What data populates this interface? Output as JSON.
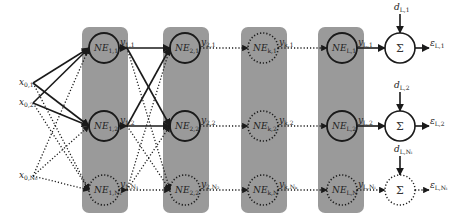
{
  "diagram": {
    "type": "layered-network-error-diagram",
    "colors": {
      "panel": "#9a9a9a",
      "stroke": "#1a1a1a",
      "background": "#ffffff"
    },
    "inputs": [
      {
        "base": "x",
        "sub": "0,1"
      },
      {
        "base": "x",
        "sub": "0,2"
      },
      {
        "base": "x",
        "sub": "0,N₀"
      }
    ],
    "layers": [
      {
        "index": 1,
        "nodes": [
          {
            "label": "NE",
            "sub": "1,1",
            "style": "solid",
            "out_base": "y",
            "out_sub": "1,1"
          },
          {
            "label": "NE",
            "sub": "1,2",
            "style": "solid",
            "out_base": "y",
            "out_sub": "1,2"
          },
          {
            "label": "NE",
            "sub": "1,N₁",
            "style": "dotted",
            "out_base": "y",
            "out_sub": "1,N₁"
          }
        ]
      },
      {
        "index": 2,
        "nodes": [
          {
            "label": "NE",
            "sub": "2,1",
            "style": "solid",
            "out_base": "y",
            "out_sub": "2,1"
          },
          {
            "label": "NE",
            "sub": "2,2",
            "style": "solid",
            "out_base": "y",
            "out_sub": "2,2"
          },
          {
            "label": "NE",
            "sub": "2,2",
            "style": "dotted",
            "out_base": "y",
            "out_sub": "2,N₂"
          }
        ]
      },
      {
        "index": "k",
        "nodes": [
          {
            "label": "NE",
            "sub": "k,1",
            "style": "dotted",
            "out_base": "y",
            "out_sub": "k,1"
          },
          {
            "label": "NE",
            "sub": "k,2",
            "style": "dotted",
            "out_base": "y",
            "out_sub": "k,2"
          },
          {
            "label": "NE",
            "sub": "k,N",
            "style": "dotted",
            "out_base": "y",
            "out_sub": "k,Nₖ"
          }
        ]
      },
      {
        "index": "L",
        "nodes": [
          {
            "label": "NE",
            "sub": "L,1",
            "style": "solid",
            "out_base": "y",
            "out_sub": "L,1"
          },
          {
            "label": "NE",
            "sub": "L,2",
            "style": "solid",
            "out_base": "y",
            "out_sub": "L,2"
          },
          {
            "label": "NE",
            "sub": "L,N",
            "style": "dotted",
            "out_base": "y",
            "out_sub": "L,Nₗ"
          }
        ]
      }
    ],
    "summers": [
      {
        "symbol": "Σ",
        "style": "solid",
        "d_base": "d",
        "d_sub": "L,1",
        "e_base": "ε",
        "e_sub": "L,1"
      },
      {
        "symbol": "Σ",
        "style": "solid",
        "d_base": "d",
        "d_sub": "L,2",
        "e_base": "ε",
        "e_sub": "L,2"
      },
      {
        "symbol": "Σ",
        "style": "dotted",
        "d_base": "d",
        "d_sub": "L,Nₗ",
        "e_base": "ε",
        "e_sub": "L,Nₗ"
      }
    ]
  }
}
